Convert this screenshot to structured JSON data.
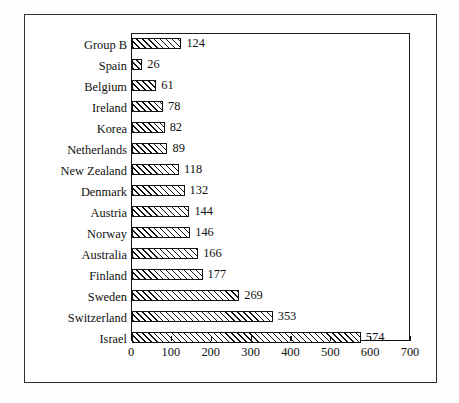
{
  "chart_data": {
    "type": "bar",
    "orientation": "horizontal",
    "title": "",
    "xlabel": "",
    "ylabel": "",
    "xlim": [
      0,
      700
    ],
    "xticks": [
      0,
      100,
      200,
      300,
      400,
      500,
      600,
      700
    ],
    "grid": false,
    "legend": false,
    "bar_style": "diagonal-hatch",
    "show_value_labels": true,
    "categories": [
      "Group B",
      "Spain",
      "Belgium",
      "Ireland",
      "Korea",
      "Netherlands",
      "New Zealand",
      "Denmark",
      "Austria",
      "Norway",
      "Australia",
      "Finland",
      "Sweden",
      "Switzerland",
      "Israel"
    ],
    "values": [
      124,
      26,
      61,
      78,
      82,
      89,
      118,
      132,
      144,
      146,
      166,
      177,
      269,
      353,
      574
    ]
  },
  "colors": {
    "bar_outline": "#111111",
    "bar_fill": "#ffffff",
    "hatch": "#111111",
    "axis": "#111111",
    "text": "#111111",
    "page_border": "#2e2e2e",
    "background": "#ffffff"
  }
}
